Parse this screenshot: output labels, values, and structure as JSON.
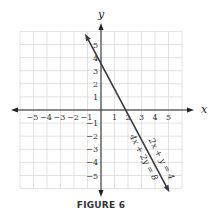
{
  "chart_data": {
    "type": "line",
    "title": "",
    "caption": "FIGURE 6",
    "xlabel": "x",
    "ylabel": "y",
    "xlim": [
      -6,
      6
    ],
    "ylim": [
      -6,
      6
    ],
    "grid": true,
    "x_ticks": [
      -5,
      -4,
      -3,
      -2,
      -1,
      1,
      2,
      3,
      4,
      5
    ],
    "y_ticks": [
      5,
      4,
      3,
      2,
      1,
      -1,
      -2,
      -3,
      -4,
      -5
    ],
    "x_tick_labels": [
      "−5",
      "−4",
      "−3",
      "−2",
      "−1",
      "1",
      "2",
      "3",
      "4",
      "5"
    ],
    "y_tick_labels": [
      "5",
      "4",
      "3",
      "2",
      "1",
      "−1",
      "−2",
      "−3",
      "−4",
      "−5"
    ],
    "series": [
      {
        "name": "2x + y = 4",
        "equation": "2x + y = 4",
        "slope": -2,
        "y_intercept": 4,
        "x_intercept": 2,
        "points": [
          [
            -1,
            6
          ],
          [
            0,
            4
          ],
          [
            2,
            0
          ],
          [
            5,
            -6
          ]
        ]
      },
      {
        "name": "4x + 2y = 8",
        "equation": "4x + 2y = 8",
        "slope": -2,
        "y_intercept": 4,
        "x_intercept": 2,
        "points": [
          [
            -1,
            6
          ],
          [
            0,
            4
          ],
          [
            2,
            0
          ],
          [
            5,
            -6
          ]
        ]
      }
    ],
    "annotations": [
      "2x + y = 4",
      "4x + 2y = 8"
    ],
    "line_color": "#3a3a3a",
    "grid_color": "#d6d6d6"
  }
}
